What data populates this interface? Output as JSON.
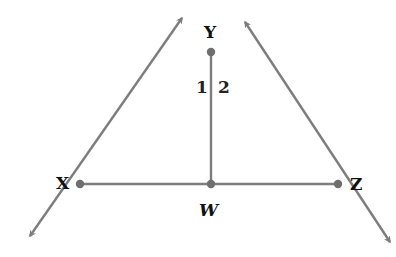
{
  "diagram": {
    "type": "geometry-figure",
    "line_color": "#7d7d7d",
    "point_color": "#6e6e6e",
    "label_color": "#111111",
    "points": [
      {
        "id": "X",
        "label": "X",
        "x": 80,
        "y": 184
      },
      {
        "id": "Y",
        "label": "Y",
        "x": 211,
        "y": 52
      },
      {
        "id": "Z",
        "label": "Z",
        "x": 338,
        "y": 184
      },
      {
        "id": "W",
        "label": "W",
        "x": 211,
        "y": 184
      }
    ],
    "segments": [
      {
        "from": "X",
        "to": "Z",
        "kind": "segment"
      },
      {
        "from": "Y",
        "to": "W",
        "kind": "segment"
      }
    ],
    "rays": [
      {
        "name": "line-XY",
        "through": [
          "Y",
          "X"
        ],
        "arrow_ends": [
          {
            "x": 182,
            "y": 18
          },
          {
            "x": 30,
            "y": 236
          }
        ]
      },
      {
        "name": "line-YZ",
        "through": [
          "Y",
          "Z"
        ],
        "arrow_ends": [
          {
            "x": 245,
            "y": 22
          },
          {
            "x": 390,
            "y": 242
          }
        ]
      }
    ],
    "angles": [
      {
        "label": "1",
        "vertex": "Y",
        "between": [
          "X",
          "W"
        ]
      },
      {
        "label": "2",
        "vertex": "Y",
        "between": [
          "W",
          "Z"
        ]
      }
    ]
  },
  "labels": {
    "X": "X",
    "Y": "Y",
    "Z": "Z",
    "W": "W",
    "angle1": "1",
    "angle2": "2"
  }
}
